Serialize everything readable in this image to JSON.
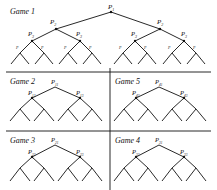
{
  "games": [
    {
      "id": "game-1",
      "title": "Game 1",
      "root": "P1",
      "level2": [
        "P2",
        "P2"
      ],
      "level3": [
        "P3",
        "P3",
        "P3",
        "P3"
      ],
      "level4": [
        "P4",
        "P4",
        "P4",
        "P4",
        "P4",
        "P4",
        "P4",
        "P4"
      ],
      "leaf": "P5"
    },
    {
      "id": "game-2",
      "title": "Game 2",
      "root": "P11",
      "level2": [
        "P12",
        "P13"
      ],
      "level3": [
        "P12",
        "P13",
        "P14",
        "P15"
      ],
      "leaf": "P1x"
    },
    {
      "id": "game-5",
      "title": "Game 5",
      "root": "P41",
      "level2": [
        "P42",
        "P43"
      ],
      "level3": [
        "P44",
        "P45",
        "P46",
        "P47"
      ],
      "leaf": "P4x"
    },
    {
      "id": "game-3",
      "title": "Game 3",
      "root": "P21",
      "level2": [
        "P22",
        "P23"
      ],
      "level3": [
        "P24",
        "P25",
        "P26",
        "P27"
      ],
      "leaf": "P2x"
    },
    {
      "id": "game-4",
      "title": "Game 4",
      "root": "P31",
      "level2": [
        "P32",
        "P33"
      ],
      "level3": [
        "P34",
        "P35",
        "P36",
        "P37"
      ],
      "leaf": "P3x"
    }
  ],
  "labels": {
    "g1_title": "Game 1",
    "g2_title": "Game 2",
    "g3_title": "Game 3",
    "g4_title": "Game 4",
    "g5_title": "Game 5",
    "P": "P",
    "g1_root_sub": "1",
    "g1_l2_sub": "2",
    "g1_l3_sub": "3",
    "g1_l4_sub": "4",
    "g2_root_sub": "11",
    "g2_l2a_sub": "12",
    "g2_l2b_sub": "13",
    "g5_root_sub": "41",
    "g5_l2a_sub": "42",
    "g5_l2b_sub": "43",
    "g3_root_sub": "21",
    "g3_l2a_sub": "22",
    "g3_l2b_sub": "23",
    "g4_root_sub": "31",
    "g4_l2a_sub": "32",
    "g4_l2b_sub": "33"
  }
}
